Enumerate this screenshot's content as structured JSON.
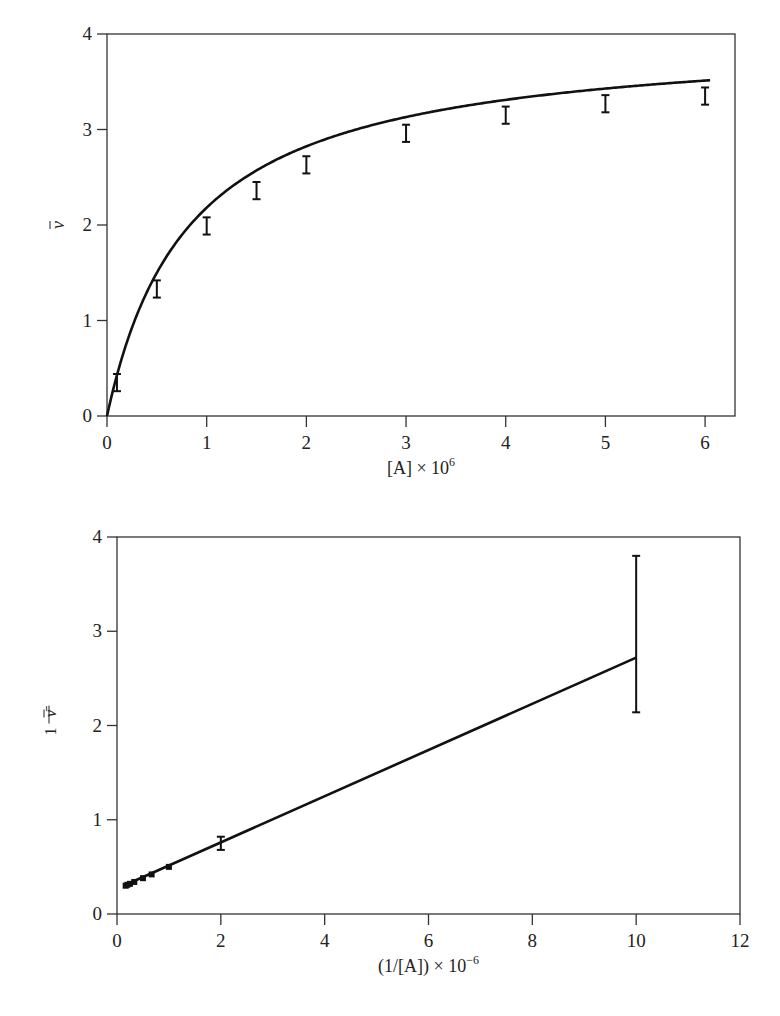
{
  "chart_data": [
    {
      "id": "saturation",
      "type": "line",
      "title": "",
      "xlabel": "[A] × 10^6",
      "xlabel_parts": {
        "base": "[A] × 10",
        "sup": "6"
      },
      "ylabel": "ν̄",
      "xlim": [
        0,
        6.3
      ],
      "ylim": [
        0,
        4
      ],
      "xticks": [
        0,
        1,
        2,
        3,
        4,
        5,
        6
      ],
      "yticks": [
        0,
        1,
        2,
        3,
        4
      ],
      "grid": false,
      "legend": null,
      "fit_curve": {
        "form": "hyperbolic",
        "n": 4,
        "K": 1200000.0,
        "description": "ν̄ = n·K[A]/(1+K[A])"
      },
      "series": [
        {
          "name": "measured ν̄",
          "x": [
            0.1,
            0.5,
            1,
            1.5,
            2,
            3,
            4,
            5,
            6
          ],
          "y": [
            0.35,
            1.33,
            1.99,
            2.36,
            2.63,
            2.96,
            3.15,
            3.27,
            3.35
          ],
          "err": [
            0.09,
            0.09,
            0.09,
            0.09,
            0.09,
            0.09,
            0.09,
            0.09,
            0.09
          ]
        }
      ]
    },
    {
      "id": "double-reciprocal",
      "type": "line",
      "title": "",
      "xlabel": "(1/[A]) × 10^−6",
      "xlabel_parts": {
        "base": "(1/[A]) × 10",
        "sup": "−6"
      },
      "ylabel": "1/ν̄",
      "ylabel_parts": {
        "num": "1",
        "den": "ν̄"
      },
      "xlim": [
        0,
        12
      ],
      "ylim": [
        0,
        4
      ],
      "xticks": [
        0,
        2,
        4,
        6,
        8,
        10,
        12
      ],
      "yticks": [
        0,
        1,
        2,
        3,
        4
      ],
      "grid": false,
      "legend": null,
      "fit_line": {
        "slope": 0.245,
        "intercept": 0.27
      },
      "series": [
        {
          "name": "measured 1/ν̄",
          "x": [
            0.167,
            0.2,
            0.25,
            0.333,
            0.5,
            0.667,
            1,
            2,
            10
          ],
          "y": [
            0.3,
            0.31,
            0.32,
            0.34,
            0.38,
            0.42,
            0.5,
            0.75,
            2.74
          ],
          "err_low": [
            0.01,
            0.01,
            0.01,
            0.01,
            0.01,
            0.015,
            0.02,
            0.07,
            0.6
          ],
          "err_high": [
            0.01,
            0.01,
            0.01,
            0.01,
            0.01,
            0.015,
            0.02,
            0.07,
            1.06
          ]
        }
      ]
    }
  ],
  "colors": {
    "ink": "#111111",
    "axis": "#333333",
    "background": "#ffffff"
  }
}
